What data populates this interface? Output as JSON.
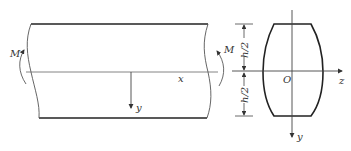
{
  "diagram": {
    "beam": {
      "moment_left_label": "M",
      "moment_right_label": "M",
      "x_axis_label": "x",
      "y_axis_label": "y"
    },
    "cross_section": {
      "origin_label": "O",
      "z_axis_label": "z",
      "y_axis_label": "y",
      "upper_half_height_label": "h/2",
      "lower_half_height_label": "h/2"
    },
    "colors": {
      "outline": "#222222",
      "thin_line": "#555555",
      "text": "#333333"
    }
  }
}
